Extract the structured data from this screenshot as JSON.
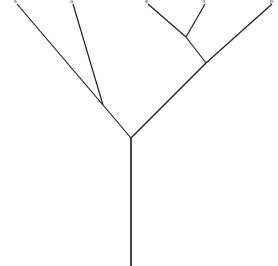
{
  "figure": {
    "kind": "phylogenetic-tree",
    "background_color": "#ffffff",
    "line_color": "#1a1a1a",
    "label_color": "#3a3a3a",
    "width": 278,
    "height": 266
  },
  "tips": [
    {
      "id": "tip-s",
      "label": "s",
      "x": 17,
      "y": 4,
      "label_x": 14,
      "label_y": -2
    },
    {
      "id": "tip-a",
      "label": "a",
      "x": 73,
      "y": 4,
      "label_x": 70,
      "label_y": -2
    },
    {
      "id": "tip-e",
      "label": "e",
      "x": 148,
      "y": 4,
      "label_x": 145,
      "label_y": -2
    },
    {
      "id": "tip-f",
      "label": "f",
      "x": 205,
      "y": 4,
      "label_x": 203,
      "label_y": -2
    },
    {
      "id": "tip-p",
      "label": "p",
      "x": 272,
      "y": 4,
      "label_x": 270,
      "label_y": -2
    }
  ],
  "nodes": [
    {
      "id": "node-root",
      "x": 131,
      "y": 138
    },
    {
      "id": "node-left",
      "x": 103,
      "y": 105
    },
    {
      "id": "node-right",
      "x": 206,
      "y": 63
    },
    {
      "id": "node-right-inner",
      "x": 186,
      "y": 37
    }
  ],
  "branches": [
    {
      "id": "branch-root-trunk",
      "from": "node-root",
      "to": "root-base",
      "x1": 131,
      "y1": 138,
      "x2": 131,
      "y2": 266,
      "trunk": true
    },
    {
      "id": "branch-root-left",
      "from": "node-root",
      "to": "node-left",
      "x1": 131,
      "y1": 138,
      "x2": 103,
      "y2": 105
    },
    {
      "id": "branch-root-right",
      "from": "node-root",
      "to": "node-right",
      "x1": 131,
      "y1": 138,
      "x2": 206,
      "y2": 63
    },
    {
      "id": "branch-left-s",
      "from": "node-left",
      "to": "tip-s",
      "x1": 103,
      "y1": 105,
      "x2": 17,
      "y2": 4
    },
    {
      "id": "branch-left-a",
      "from": "node-left",
      "to": "tip-a",
      "x1": 103,
      "y1": 105,
      "x2": 73,
      "y2": 4
    },
    {
      "id": "branch-right-p",
      "from": "node-right",
      "to": "tip-p",
      "x1": 206,
      "y1": 63,
      "x2": 272,
      "y2": 4
    },
    {
      "id": "branch-right-inner",
      "from": "node-right",
      "to": "node-right-inner",
      "x1": 206,
      "y1": 63,
      "x2": 186,
      "y2": 37
    },
    {
      "id": "branch-inner-e",
      "from": "node-right-inner",
      "to": "tip-e",
      "x1": 186,
      "y1": 37,
      "x2": 148,
      "y2": 4
    },
    {
      "id": "branch-inner-f",
      "from": "node-right-inner",
      "to": "tip-f",
      "x1": 186,
      "y1": 37,
      "x2": 205,
      "y2": 4
    }
  ]
}
